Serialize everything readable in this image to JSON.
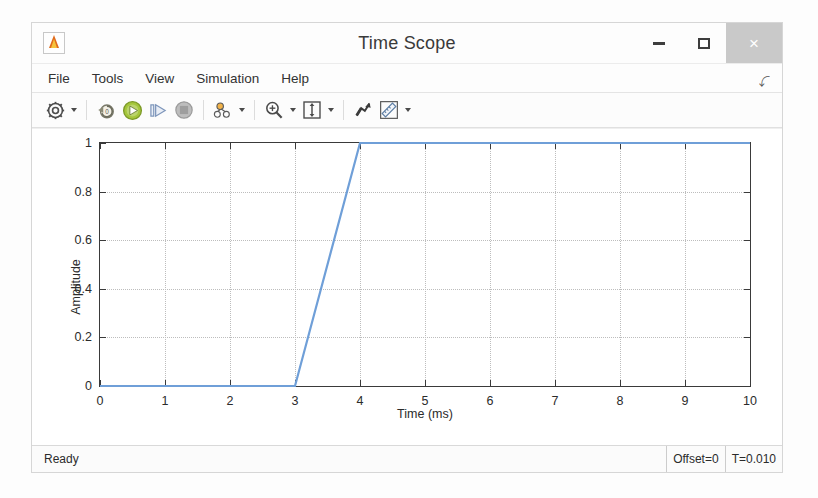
{
  "window": {
    "title": "Time Scope",
    "app_icon": "matlab-scope-icon",
    "buttons": {
      "minimize": "minimize-icon",
      "maximize": "maximize-icon",
      "close": "×"
    }
  },
  "menubar": {
    "items": [
      {
        "label": "File",
        "name": "menu-file"
      },
      {
        "label": "Tools",
        "name": "menu-tools"
      },
      {
        "label": "View",
        "name": "menu-view"
      },
      {
        "label": "Simulation",
        "name": "menu-simulation"
      },
      {
        "label": "Help",
        "name": "menu-help"
      }
    ],
    "expander": "⤵"
  },
  "toolbar": {
    "buttons": [
      {
        "name": "configuration-properties-icon",
        "caret": true
      },
      {
        "name": "rewind-to-start-icon",
        "caret": false
      },
      {
        "name": "run-play-icon",
        "caret": false
      },
      {
        "name": "step-forward-icon",
        "caret": false
      },
      {
        "name": "stop-icon",
        "caret": false
      },
      {
        "name": "signal-selection-icon",
        "caret": true
      },
      {
        "name": "zoom-in-icon",
        "caret": true
      },
      {
        "name": "autoscale-fit-icon",
        "caret": true
      },
      {
        "name": "highlight-signal-icon",
        "caret": false
      },
      {
        "name": "measurements-ruler-icon",
        "caret": true
      }
    ]
  },
  "statusbar": {
    "status": "Ready",
    "offset": "Offset=0",
    "time": "T=0.010"
  },
  "chart_data": {
    "type": "line",
    "title": "",
    "xlabel": "Time (ms)",
    "ylabel": "Amplitude",
    "xlim": [
      0,
      10
    ],
    "ylim": [
      0,
      1
    ],
    "xticks": [
      0,
      1,
      2,
      3,
      4,
      5,
      6,
      7,
      8,
      9,
      10
    ],
    "xtick_labels": [
      "0",
      "1",
      "2",
      "3",
      "4",
      "5",
      "6",
      "7",
      "8",
      "9",
      "10"
    ],
    "yticks": [
      0,
      0.2,
      0.4,
      0.6,
      0.8,
      1
    ],
    "ytick_labels": [
      "0",
      "0.2",
      "0.4",
      "0.6",
      "0.8",
      "1"
    ],
    "grid": true,
    "legend": null,
    "line_color": "#6f9fd8",
    "line_width": 2.2,
    "series": [
      {
        "name": "signal",
        "x": [
          0,
          1,
          2,
          3,
          4,
          5,
          6,
          7,
          8,
          9,
          10
        ],
        "y": [
          0,
          0,
          0,
          0,
          1,
          1,
          1,
          1,
          1,
          1,
          1
        ]
      }
    ]
  }
}
